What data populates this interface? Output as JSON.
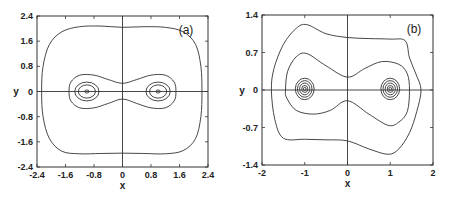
{
  "chart_data": [
    {
      "panel": "(a)",
      "type": "line",
      "title": "",
      "xlabel": "x",
      "ylabel": "y",
      "xlim": [
        -2.4,
        2.4
      ],
      "ylim": [
        -2.4,
        2.4
      ],
      "xticks": [
        -2.4,
        -1.6,
        -0.8,
        0,
        0.8,
        1.6,
        2.4
      ],
      "yticks": [
        -2.4,
        -1.6,
        -0.8,
        0,
        0.8,
        1.6,
        2.4
      ],
      "xtick_labels": [
        "-2.4",
        "-1.6",
        "-0.8",
        "0",
        "0.8",
        "1.6",
        "2.4"
      ],
      "ytick_labels": [
        "-2.4",
        "-1.6",
        "-0.8",
        "0",
        "0.8",
        "1.6",
        "2.4"
      ],
      "grid": false,
      "zero_axes": true,
      "description": "Phase portrait: closed orbits around two centers at (-1,0) and (1,0), a figure-eight-like orbit enclosing both, and a large outer orbit",
      "centers": [
        [
          -1.0,
          0
        ],
        [
          1.0,
          0
        ]
      ],
      "series": [
        {
          "name": "outer orbit",
          "points": [
            [
              0,
              2.04
            ],
            [
              0.6,
              2.06
            ],
            [
              1.2,
              2.04
            ],
            [
              1.7,
              1.9
            ],
            [
              2.05,
              1.5
            ],
            [
              2.2,
              0.8
            ],
            [
              2.23,
              0
            ],
            [
              2.2,
              -0.8
            ],
            [
              2.05,
              -1.5
            ],
            [
              1.7,
              -1.88
            ],
            [
              1.2,
              -1.98
            ],
            [
              0.6,
              -1.97
            ],
            [
              0,
              -1.96
            ],
            [
              -0.6,
              -1.97
            ],
            [
              -1.2,
              -1.98
            ],
            [
              -1.7,
              -1.9
            ],
            [
              -2.05,
              -1.5
            ],
            [
              -2.23,
              -0.8
            ],
            [
              -2.27,
              0
            ],
            [
              -2.23,
              0.8
            ],
            [
              -2.05,
              1.5
            ],
            [
              -1.7,
              1.9
            ],
            [
              -1.2,
              2.06
            ],
            [
              -0.6,
              2.08
            ],
            [
              0,
              2.04
            ]
          ]
        },
        {
          "name": "enclosing orbit",
          "points": [
            [
              0,
              0.26
            ],
            [
              0.4,
              0.38
            ],
            [
              0.8,
              0.52
            ],
            [
              1.2,
              0.52
            ],
            [
              1.45,
              0.3
            ],
            [
              1.5,
              0
            ],
            [
              1.45,
              -0.3
            ],
            [
              1.2,
              -0.52
            ],
            [
              0.8,
              -0.52
            ],
            [
              0.4,
              -0.38
            ],
            [
              0,
              -0.24
            ],
            [
              -0.4,
              -0.38
            ],
            [
              -0.8,
              -0.52
            ],
            [
              -1.2,
              -0.52
            ],
            [
              -1.45,
              -0.3
            ],
            [
              -1.5,
              0
            ],
            [
              -1.45,
              0.3
            ],
            [
              -1.2,
              0.52
            ],
            [
              -0.8,
              0.52
            ],
            [
              -0.4,
              0.38
            ],
            [
              0,
              0.26
            ]
          ]
        },
        {
          "name": "orbit left r=0.34",
          "center": [
            -1.0,
            0
          ],
          "rx": 0.34,
          "ry": 0.3
        },
        {
          "name": "orbit left r=0.24",
          "center": [
            -1.0,
            0
          ],
          "rx": 0.24,
          "ry": 0.21
        },
        {
          "name": "orbit left r=0.05",
          "center": [
            -1.0,
            0
          ],
          "rx": 0.06,
          "ry": 0.05
        },
        {
          "name": "orbit right r=0.34",
          "center": [
            1.0,
            0
          ],
          "rx": 0.34,
          "ry": 0.3
        },
        {
          "name": "orbit right r=0.24",
          "center": [
            1.0,
            0
          ],
          "rx": 0.24,
          "ry": 0.21
        },
        {
          "name": "orbit right r=0.05",
          "center": [
            1.0,
            0
          ],
          "rx": 0.06,
          "ry": 0.05
        }
      ]
    },
    {
      "panel": "(b)",
      "type": "line",
      "title": "",
      "xlabel": "x",
      "ylabel": "y",
      "xlim": [
        -2,
        2
      ],
      "ylim": [
        -1.4,
        1.4
      ],
      "xticks": [
        -2,
        -1,
        0,
        1,
        2
      ],
      "yticks": [
        -1.4,
        -0.7,
        0,
        0.7,
        1.4
      ],
      "xtick_labels": [
        "-2",
        "-1",
        "0",
        "1",
        "2"
      ],
      "ytick_labels": [
        "-1.4",
        "-0.7",
        "0",
        "0.7",
        "1.4"
      ],
      "grid": false,
      "zero_axes": true,
      "description": "Asymmetric phase portrait: nested orbits around centers at (-1,0) and (1,0), a skewed enclosing orbit, and a skewed outer orbit",
      "centers": [
        [
          -1.0,
          0
        ],
        [
          1.0,
          0
        ]
      ],
      "series": [
        {
          "name": "outer orbit",
          "points": [
            [
              0,
              0.98
            ],
            [
              0.5,
              0.96
            ],
            [
              1.0,
              0.95
            ],
            [
              1.35,
              0.92
            ],
            [
              1.45,
              0.6
            ],
            [
              1.6,
              0.3
            ],
            [
              1.72,
              0
            ],
            [
              1.62,
              -0.4
            ],
            [
              1.45,
              -0.8
            ],
            [
              1.2,
              -1.1
            ],
            [
              0.95,
              -1.2
            ],
            [
              0.5,
              -1.1
            ],
            [
              0,
              -0.95
            ],
            [
              -0.5,
              -0.93
            ],
            [
              -1.0,
              -0.92
            ],
            [
              -1.5,
              -0.9
            ],
            [
              -1.7,
              -0.55
            ],
            [
              -1.78,
              0
            ],
            [
              -1.72,
              0.4
            ],
            [
              -1.5,
              0.85
            ],
            [
              -1.2,
              1.15
            ],
            [
              -0.95,
              1.22
            ],
            [
              -0.5,
              1.05
            ],
            [
              0,
              0.98
            ]
          ]
        },
        {
          "name": "enclosing orbit",
          "points": [
            [
              0,
              0.24
            ],
            [
              0.4,
              0.4
            ],
            [
              0.8,
              0.53
            ],
            [
              1.2,
              0.48
            ],
            [
              1.4,
              0.3
            ],
            [
              1.45,
              0
            ],
            [
              1.4,
              -0.4
            ],
            [
              1.2,
              -0.6
            ],
            [
              0.95,
              -0.66
            ],
            [
              0.5,
              -0.45
            ],
            [
              0,
              -0.2
            ],
            [
              -0.4,
              -0.38
            ],
            [
              -0.8,
              -0.45
            ],
            [
              -1.2,
              -0.38
            ],
            [
              -1.42,
              -0.15
            ],
            [
              -1.45,
              0
            ],
            [
              -1.4,
              0.35
            ],
            [
              -1.2,
              0.62
            ],
            [
              -0.95,
              0.68
            ],
            [
              -0.5,
              0.45
            ],
            [
              0,
              0.24
            ]
          ]
        },
        {
          "name": "orbit left r=0.22",
          "center": [
            -1.0,
            0.02
          ],
          "rx": 0.22,
          "ry": 0.2
        },
        {
          "name": "orbit left r=0.17",
          "center": [
            -1.0,
            0.02
          ],
          "rx": 0.17,
          "ry": 0.155
        },
        {
          "name": "orbit left r=0.12",
          "center": [
            -1.0,
            0.02
          ],
          "rx": 0.12,
          "ry": 0.11
        },
        {
          "name": "orbit left r=0.07",
          "center": [
            -1.0,
            0.02
          ],
          "rx": 0.07,
          "ry": 0.065
        },
        {
          "name": "orbit left r=0.03",
          "center": [
            -1.0,
            0.02
          ],
          "rx": 0.03,
          "ry": 0.03
        },
        {
          "name": "orbit right r=0.22",
          "center": [
            1.0,
            0.02
          ],
          "rx": 0.22,
          "ry": 0.2
        },
        {
          "name": "orbit right r=0.17",
          "center": [
            1.0,
            0.02
          ],
          "rx": 0.17,
          "ry": 0.155
        },
        {
          "name": "orbit right r=0.12",
          "center": [
            1.0,
            0.02
          ],
          "rx": 0.12,
          "ry": 0.11
        },
        {
          "name": "orbit right r=0.07",
          "center": [
            1.0,
            0.02
          ],
          "rx": 0.07,
          "ry": 0.065
        },
        {
          "name": "orbit right r=0.03",
          "center": [
            1.0,
            0.02
          ],
          "rx": 0.03,
          "ry": 0.03
        }
      ]
    }
  ],
  "panels": {
    "a": {
      "label": "(a)",
      "xlabel": "x",
      "ylabel": "y",
      "frame": {
        "x0": 37,
        "x1": 208,
        "y0": 16,
        "y1": 167
      }
    },
    "b": {
      "label": "(b)",
      "xlabel": "x",
      "ylabel": "y",
      "frame": {
        "x0": 262,
        "x1": 433,
        "y0": 15,
        "y1": 165
      }
    }
  },
  "colors": {
    "line": "#333333",
    "text": "#222222",
    "background": "#ffffff"
  }
}
